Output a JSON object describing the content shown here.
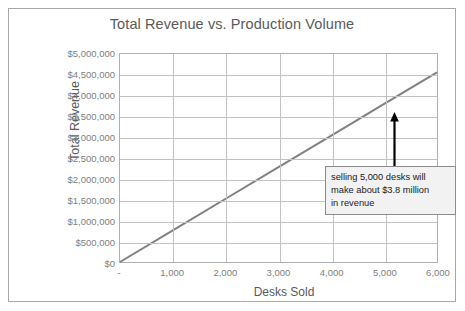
{
  "chart_data": {
    "type": "line",
    "title": "Total Revenue vs. Production Volume",
    "xlabel": "Desks Sold",
    "ylabel": "Total Revenue",
    "grid": true,
    "legend": false,
    "xlim": [
      0,
      6000
    ],
    "ylim": [
      0,
      5000000
    ],
    "x_tick_values": [
      0,
      1000,
      2000,
      3000,
      4000,
      5000,
      6000
    ],
    "x_tick_labels": [
      "-",
      "1,000",
      "2,000",
      "3,000",
      "4,000",
      "5,000",
      "6,000"
    ],
    "y_tick_values": [
      0,
      500000,
      1000000,
      1500000,
      2000000,
      2500000,
      3000000,
      3500000,
      4000000,
      4500000,
      5000000
    ],
    "y_tick_labels": [
      "$0",
      "$500,000",
      "$1,000,000",
      "$1,500,000",
      "$2,000,000",
      "$2,500,000",
      "$3,000,000",
      "$3,500,000",
      "$4,000,000",
      "$4,500,000",
      "$5,000,000"
    ],
    "series": [
      {
        "name": "Total Revenue",
        "color": "#808080",
        "line_width": 2,
        "x": [
          0,
          1000,
          2000,
          3000,
          4000,
          5000,
          6000
        ],
        "values": [
          0,
          760000,
          1520000,
          2280000,
          3040000,
          3800000,
          4560000
        ]
      }
    ],
    "annotations": [
      {
        "name": "revenue-callout",
        "lines": [
          "selling 5,000 desks will",
          "make about $3.8 million",
          "in revenue"
        ],
        "points_to_x": 5000,
        "points_to_y": 3800000,
        "box_fill": "#f2f2f2",
        "box_border": "#8c8c8c",
        "arrow_color": "#000000"
      }
    ]
  },
  "colors": {
    "card_border": "#a8a8a8",
    "plot_border": "#b0b0b0",
    "gridline": "#c2c2c2",
    "text": "#5a5a5a",
    "tick_text": "#808080",
    "series": "#808080"
  }
}
